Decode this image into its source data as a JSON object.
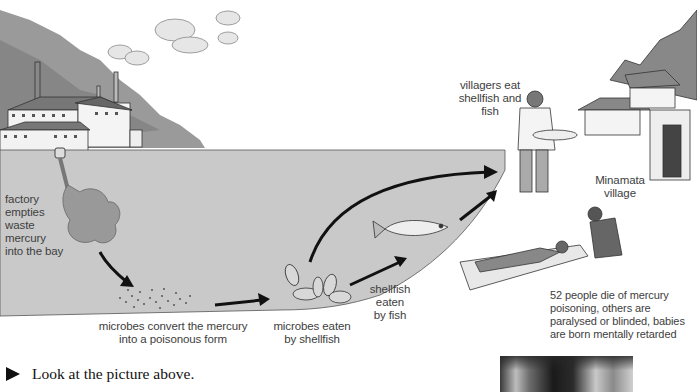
{
  "figure": {
    "colors": {
      "water": "#c9c9c9",
      "ink": "#1a1a1a",
      "hill": "#8e8e8e",
      "text": "#404040"
    },
    "labels": {
      "factory": [
        "factory",
        "empties",
        "waste",
        "mercury",
        "into the bay"
      ],
      "microbes_convert": [
        "microbes convert the mercury",
        "into a poisonous form"
      ],
      "microbes_eaten": [
        "microbes eaten",
        "by shellfish"
      ],
      "shellfish_eaten": [
        "shellfish",
        "eaten",
        "by fish"
      ],
      "villagers_eat": [
        "villagers eat",
        "shellfish and",
        "fish"
      ],
      "village": [
        "Minamata",
        "village"
      ],
      "consequences": [
        "52 people die of mercury",
        "poisoning, others are",
        "paralysed or blinded, babies",
        "are born mentally retarded"
      ]
    }
  },
  "instruction": {
    "text": "Look at the picture above."
  }
}
